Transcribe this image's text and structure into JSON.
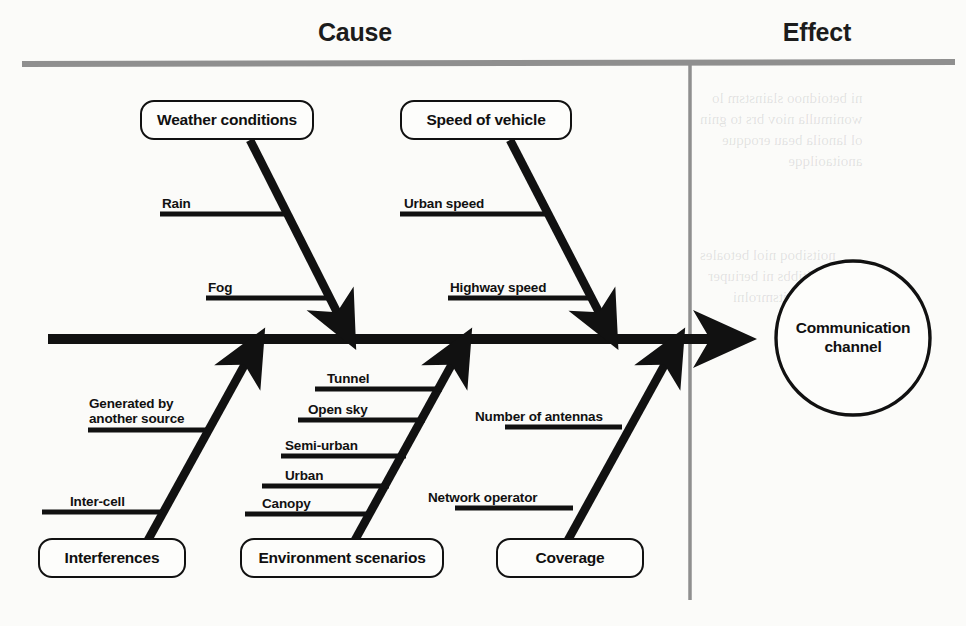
{
  "diagram": {
    "type": "fishbone-ishikawa",
    "title_left": "Cause",
    "title_right": "Effect",
    "effect": {
      "label_line1": "Communication",
      "label_line2": "channel"
    },
    "ink_color": "#111111",
    "rule_color": "#8c8c8c",
    "background_color": "#fbfbf9",
    "categories": [
      {
        "id": "weather-conditions",
        "label": "Weather conditions",
        "position": "top",
        "causes": [
          "Rain",
          "Fog"
        ]
      },
      {
        "id": "speed-of-vehicle",
        "label": "Speed of vehicle",
        "position": "top",
        "causes": [
          "Urban speed",
          "Highway speed"
        ]
      },
      {
        "id": "interferences",
        "label": "Interferences",
        "position": "bottom",
        "causes": [
          "Generated by another source",
          "Inter-cell"
        ]
      },
      {
        "id": "environment-scenarios",
        "label": "Environment scenarios",
        "position": "bottom",
        "causes": [
          "Tunnel",
          "Open sky",
          "Semi-urban",
          "Urban",
          "Canopy"
        ]
      },
      {
        "id": "coverage",
        "label": "Coverage",
        "position": "bottom",
        "causes": [
          "Number of antennas",
          "Network operator"
        ]
      }
    ],
    "sub_labels": {
      "rain": "Rain",
      "fog": "Fog",
      "urban_speed": "Urban speed",
      "highway_speed": "Highway speed",
      "generated_by": "Generated by",
      "another_source": "another source",
      "inter_cell": "Inter-cell",
      "tunnel": "Tunnel",
      "open_sky": "Open sky",
      "semi_urban": "Semi-urban",
      "urban": "Urban",
      "canopy": "Canopy",
      "number_of_antennas": "Number of antennas",
      "network_operator": "Network operator"
    },
    "box_labels": {
      "weather": "Weather conditions",
      "speed": "Speed of vehicle",
      "interferences": "Interferences",
      "environment": "Environment scenarios",
      "coverage": "Coverage"
    }
  }
}
